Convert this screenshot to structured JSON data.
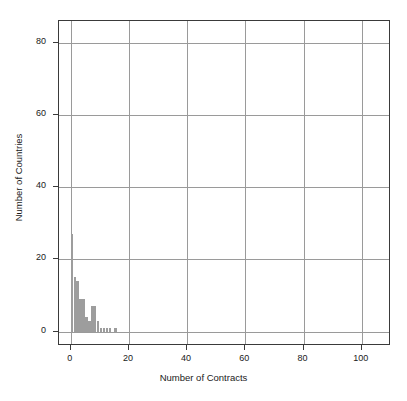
{
  "chart_data": {
    "type": "bar",
    "title": "",
    "subtitle": "",
    "xlabel": "Number of Contracts",
    "ylabel": "Number of Countries",
    "xlim": [
      -4,
      110
    ],
    "ylim": [
      -4,
      86
    ],
    "xticks": [
      0,
      20,
      40,
      60,
      80,
      100
    ],
    "yticks": [
      0,
      20,
      40,
      60,
      80
    ],
    "xtick_labels": [
      "0",
      "20",
      "40",
      "60",
      "80",
      "100"
    ],
    "ytick_labels": [
      "0",
      "20",
      "40",
      "60",
      "80"
    ],
    "grid": true,
    "legend": null,
    "bin_width": 1,
    "categories": [
      1,
      2,
      3,
      4,
      5,
      6,
      7,
      8,
      9,
      10,
      11,
      12,
      13,
      14,
      15,
      16
    ],
    "values": [
      27,
      15,
      14,
      9,
      9,
      4,
      3,
      7,
      7,
      3,
      1,
      1,
      1,
      1,
      0,
      1
    ],
    "bars": [
      {
        "x": 1,
        "height": 27
      },
      {
        "x": 2,
        "height": 15
      },
      {
        "x": 3,
        "height": 14
      },
      {
        "x": 4,
        "height": 9
      },
      {
        "x": 5,
        "height": 9
      },
      {
        "x": 6,
        "height": 4
      },
      {
        "x": 7,
        "height": 3
      },
      {
        "x": 8,
        "height": 7
      },
      {
        "x": 9,
        "height": 7
      },
      {
        "x": 10,
        "height": 3
      },
      {
        "x": 11,
        "height": 1
      },
      {
        "x": 12,
        "height": 1
      },
      {
        "x": 13,
        "height": 1
      },
      {
        "x": 14,
        "height": 1
      },
      {
        "x": 15,
        "height": 0
      },
      {
        "x": 16,
        "height": 1
      }
    ],
    "colors": {
      "bar_fill": "#9d9d9d",
      "grid": "#9a9a9a",
      "frame": "#3a3a3a",
      "text": "#1a1a1a",
      "background": "#ffffff"
    }
  }
}
